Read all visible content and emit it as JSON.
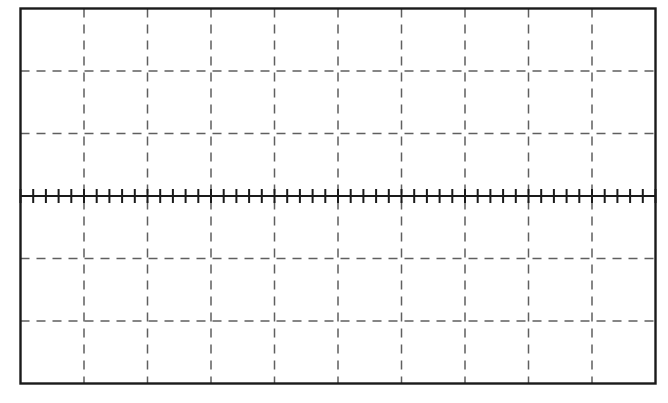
{
  "figure": {
    "kind": "oscilloscope-graticule",
    "title": "",
    "caption": "",
    "background_color": "#ffffff"
  },
  "chart_data": {
    "type": "scatter",
    "title": "",
    "subtitle": "",
    "xlabel": "",
    "ylabel": "",
    "description": "Blank oscilloscope graticule: 10 horizontal divisions by 6 vertical divisions, dashed interior gridlines, solid outer frame, and a solid horizontal center axis carrying fine minor tick marks.",
    "series": [
      {
        "name": "trace",
        "x": [],
        "values": []
      }
    ],
    "categories": [],
    "x": [],
    "xlim": [
      -5,
      5
    ],
    "ylim": [
      -3,
      3
    ],
    "x_divisions": 10,
    "y_divisions": 6,
    "x_tick_labels": [],
    "y_tick_labels": [],
    "grid": true,
    "grid_style": "dashed",
    "legend": false,
    "legend_position": "none",
    "annotations": [],
    "center_axis": {
      "visible": true,
      "orientation": "horizontal",
      "value": 0,
      "minor_ticks_total": 50,
      "minor_ticks_per_division": 5,
      "minor_tick_half_length_px": 7
    },
    "center_axis_vertical": {
      "visible": false
    }
  },
  "geometry": {
    "frame_left": 20.5,
    "frame_top": 8.5,
    "frame_right": 655.5,
    "frame_bottom": 383.5,
    "frame_width": 635,
    "frame_height": 375,
    "column_step": 63.5,
    "row_step": 62.5,
    "axis_y": 196,
    "vertical_gridlines_x": [
      84,
      147.5,
      211,
      274.5,
      338,
      401.5,
      465,
      528.5,
      592
    ],
    "horizontal_gridlines_y": [
      71,
      133.5,
      258.5,
      321
    ],
    "tick_start_x": 20.5,
    "tick_step": 12.7
  },
  "style": {
    "frame_color": "#1a1a1a",
    "frame_width_px": 2.4,
    "grid_color": "#5f5f5f",
    "grid_width_px": 1.5,
    "grid_dash": "9 7",
    "axis_color": "#1a1a1a",
    "axis_width_px": 2.2,
    "tick_color": "#1a1a1a",
    "tick_width_px": 2.0
  }
}
